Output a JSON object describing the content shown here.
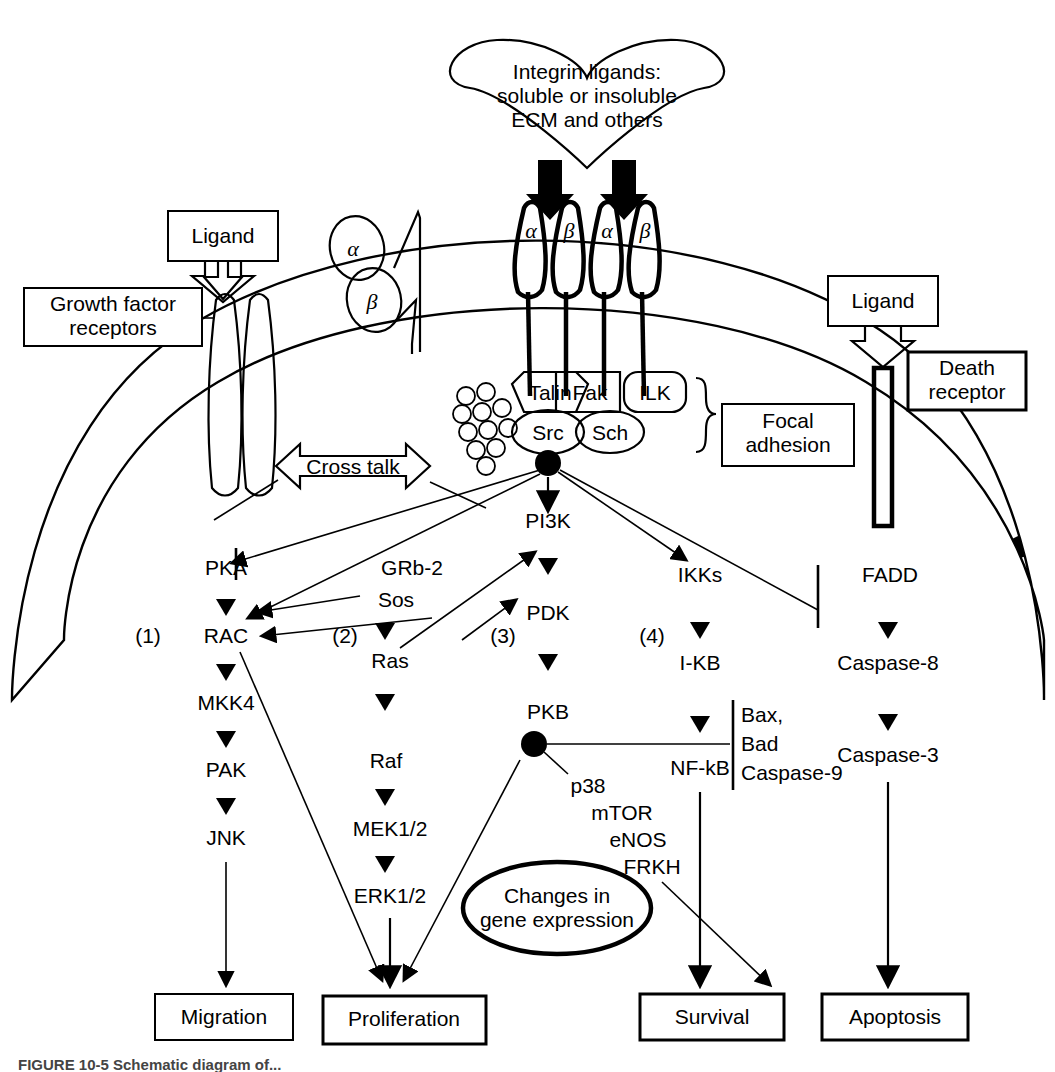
{
  "figure": {
    "domain": "biological-signaling-pathway-diagram",
    "caption_partial": "FIGURE 10-5  Schematic diagram of...",
    "extracellular": {
      "integrin_ligand_callout": "Integrin ligands:\nsoluble or insoluble\nECM and others",
      "integrin_ligand_lines": [
        "Integrin ligands:",
        "soluble or insoluble",
        "ECM and others"
      ],
      "growth_factor_ligand": "Ligand",
      "growth_factor_receptor": "Growth factor\nreceptors",
      "growth_factor_receptor_lines": [
        "Growth factor",
        "receptors"
      ],
      "death_ligand": "Ligand",
      "death_receptor": "Death\nreceptor",
      "death_receptor_lines": [
        "Death",
        "receptor"
      ],
      "integrin_subunits_unbound": [
        "α",
        "β"
      ],
      "integrin_subunits_bound": [
        "α",
        "β",
        "α",
        "β"
      ]
    },
    "focal_adhesion": {
      "bracket_label": "Focal\nadhesion",
      "bracket_label_lines": [
        "Focal",
        "adhesion"
      ],
      "components": [
        "Talin",
        "Fak",
        "ILK",
        "Src",
        "Sch"
      ]
    },
    "crosstalk_label": "Cross talk",
    "pathways": [
      {
        "number": "(1)",
        "nodes": [
          "PKA",
          "RAC",
          "MKK4",
          "PAK",
          "JNK"
        ],
        "outcome": "Migration"
      },
      {
        "number": "(2)",
        "nodes": [
          "GRb-2",
          "Sos",
          "Ras",
          "Raf",
          "MEK1/2",
          "ERK1/2"
        ],
        "outcome": "Proliferation"
      },
      {
        "number": "(3)",
        "nodes": [
          "PI3K",
          "PDK",
          "PKB"
        ],
        "pkb_targets": [
          "p38",
          "mTOR",
          "eNOS",
          "FRKH"
        ],
        "outcome": "Survival"
      },
      {
        "number": "(4)",
        "nodes": [
          "IKKs",
          "I-KB",
          "NF-kB"
        ],
        "outcome": "Survival"
      }
    ],
    "death_pathway": {
      "nodes": [
        "FADD",
        "Caspase-8",
        "Caspase-3"
      ],
      "outcome": "Apoptosis"
    },
    "apoptotic_targets": [
      "Bax,",
      "Bad",
      "Caspase-9"
    ],
    "gene_expression_ellipse": "Changes in\ngene expression",
    "gene_expression_lines": [
      "Changes in",
      "gene expression"
    ],
    "outcomes": [
      "Migration",
      "Proliferation",
      "Survival",
      "Apoptosis"
    ]
  },
  "colors": {
    "ink": "#000000",
    "paper": "#ffffff",
    "caption": "#3a3a3a"
  }
}
